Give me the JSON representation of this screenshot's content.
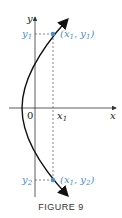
{
  "figure": {
    "caption": "FIGURE 9",
    "axes": {
      "x_label": "x",
      "y_label": "y",
      "origin_label": "0"
    },
    "ticks": {
      "x1": "x",
      "x1_sub": "1",
      "y1": "y",
      "y1_sub": "1",
      "y2": "y",
      "y2_sub": "2"
    },
    "points": [
      {
        "name": "upper",
        "label_pre": "(x",
        "sub1": "1",
        "mid": ", y",
        "sub2": "1",
        "post": ")"
      },
      {
        "name": "lower",
        "label_pre": "(x",
        "sub1": "1",
        "mid": ", y",
        "sub2": "2",
        "post": ")"
      }
    ],
    "colors": {
      "accent": "#4a8ec6",
      "curve": "#111111",
      "axis": "#333333",
      "dashed": "#555555"
    }
  }
}
